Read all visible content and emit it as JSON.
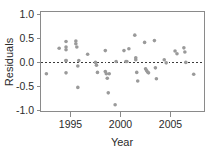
{
  "chart_data": {
    "type": "scatter",
    "title": "",
    "xlabel": "Year",
    "ylabel": "Residuals",
    "xlim": [
      1992.4,
      2009.1
    ],
    "ylim": [
      -1.12,
      1.08
    ],
    "grid": false,
    "legend": null,
    "point_color": "#9a9a9a",
    "point_radius": 1.8,
    "xticks": [
      1995,
      2000,
      2005
    ],
    "xtick_labels": [
      "1995",
      "2000",
      "2005"
    ],
    "yticks": [
      -1.0,
      -0.5,
      0.0,
      0.5,
      1.0
    ],
    "ytick_labels": [
      "-1.0",
      "-0.5",
      "0.0",
      "0.5",
      "1.0"
    ],
    "annotations": [
      {
        "type": "hline",
        "y": -0.03,
        "style": "dashed",
        "color": "#3a3a3a",
        "label": "zero-reference-line"
      }
    ],
    "x": [
      1993.0,
      1994.3,
      1995.0,
      1995.0,
      1995.0,
      1995.0,
      1995.0,
      1995.0,
      1996.0,
      1996.0,
      1996.1,
      1996.2,
      1996.2,
      1996.3,
      1997.2,
      1998.0,
      1998.1,
      1998.2,
      1999.0,
      1999.0,
      1999.1,
      1999.2,
      1999.3,
      1999.4,
      2000.0,
      2000.1,
      2000.9,
      2001.1,
      2001.2,
      2001.4,
      2002.0,
      2002.1,
      2002.1,
      2002.2,
      2002.3,
      2003.0,
      2003.1,
      2003.2,
      2003.3,
      2003.4,
      2004.0,
      2004.1,
      2004.2,
      2005.0,
      2005.2,
      2006.1,
      2006.3,
      2007.0,
      2007.1,
      2007.2,
      2008.0
    ],
    "y": [
      -0.29,
      0.27,
      0.42,
      0.3,
      0.24,
      0.0,
      0.0,
      -0.27,
      0.43,
      0.37,
      0.3,
      -0.12,
      -0.59,
      0.0,
      0.14,
      -0.04,
      -0.1,
      -0.26,
      0.22,
      -0.24,
      -0.29,
      -0.39,
      -0.71,
      -0.29,
      -0.97,
      -0.02,
      0.22,
      -0.02,
      -0.02,
      0.26,
      0.56,
      0.06,
      0.02,
      -0.26,
      -0.45,
      0.4,
      -0.18,
      -0.22,
      -0.25,
      -0.27,
      0.44,
      -0.16,
      -0.4,
      0.02,
      -0.05,
      0.21,
      0.15,
      0.28,
      0.19,
      -0.04,
      -0.3
    ]
  },
  "axes": {
    "y_title": "Residuals",
    "x_title": "Year"
  }
}
